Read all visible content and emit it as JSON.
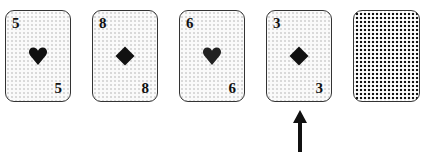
{
  "diagram": {
    "cards": [
      {
        "rank": "5",
        "suit": "heart",
        "face": "up"
      },
      {
        "rank": "8",
        "suit": "diamond",
        "face": "up"
      },
      {
        "rank": "6",
        "suit": "heart",
        "face": "up"
      },
      {
        "rank": "3",
        "suit": "diamond",
        "face": "up"
      },
      {
        "rank": "",
        "suit": "",
        "face": "down"
      }
    ],
    "arrow": {
      "points_to_card_index": 3,
      "direction": "up"
    },
    "colors": {
      "ink": "#111111",
      "card_border": "#333333",
      "card_fill": "#fafafa"
    }
  }
}
